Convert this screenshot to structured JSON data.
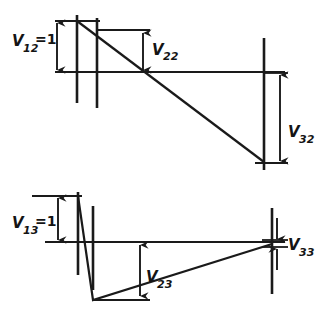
{
  "figure": {
    "background_color": "#ffffff",
    "line_color": "#1a1a1a"
  },
  "diagrams": [
    {
      "id": "upper-diagram",
      "name": "second-mode-diagram",
      "baseline_y": 72,
      "labels": [
        {
          "id": "v12",
          "name": "label-v12",
          "symbol": "V",
          "subscript": "12",
          "equals": "=1",
          "full_text": "V12=1",
          "x": 12,
          "y": 46
        },
        {
          "id": "v22",
          "name": "label-v22",
          "symbol": "V",
          "subscript": "22",
          "equals": "",
          "full_text": "V22",
          "x": 152,
          "y": 55
        },
        {
          "id": "v32",
          "name": "label-v32",
          "symbol": "V",
          "subscript": "32",
          "equals": "",
          "full_text": "V32",
          "x": 283,
          "y": 137
        }
      ],
      "node_lines": [
        {
          "name": "node-line-1",
          "x": 77,
          "y1": 15,
          "y2": 103
        },
        {
          "name": "node-line-2",
          "x": 97,
          "y1": 18,
          "y2": 108
        },
        {
          "name": "node-line-3",
          "x": 264,
          "y1": 38,
          "y2": 170
        }
      ],
      "deflection_path": "M 77 21 L 264 162",
      "dimensions": [
        {
          "name": "dim-v12",
          "x": 57,
          "y_top": 21,
          "y_bottom": 72
        },
        {
          "name": "dim-v22",
          "x": 143,
          "y_top": 33,
          "y_bottom": 72
        },
        {
          "name": "dim-v32",
          "x": 280,
          "y_top": 73,
          "y_bottom": 163
        }
      ]
    },
    {
      "id": "lower-diagram",
      "name": "third-mode-diagram",
      "baseline_y": 242,
      "labels": [
        {
          "id": "v13",
          "name": "label-v13",
          "symbol": "V",
          "subscript": "13",
          "equals": "=1",
          "full_text": "V13=1",
          "x": 12,
          "y": 228
        },
        {
          "id": "v23",
          "name": "label-v23",
          "symbol": "V",
          "subscript": "23",
          "equals": "",
          "full_text": "V23",
          "x": 148,
          "y": 282
        },
        {
          "id": "v33",
          "name": "label-v33",
          "symbol": "V",
          "subscript": "33",
          "equals": "",
          "full_text": "V33",
          "x": 291,
          "y": 250
        }
      ],
      "node_lines": [
        {
          "name": "node-line-1",
          "x": 78,
          "y1": 192,
          "y2": 275
        },
        {
          "name": "node-line-2",
          "x": 93,
          "y1": 206,
          "y2": 290
        },
        {
          "name": "node-line-3",
          "x": 272,
          "y1": 208,
          "y2": 294
        }
      ],
      "deflection_path": "M 78 196 L 93 300 L 272 244",
      "dimensions": [
        {
          "name": "dim-v13",
          "x": 58,
          "y_top": 196,
          "y_bottom": 242
        },
        {
          "name": "dim-v23",
          "x": 140,
          "y_top": 243,
          "y_bottom": 298
        },
        {
          "name": "dim-v33",
          "x": 277,
          "y_top": 218,
          "y_bottom": 270
        }
      ]
    }
  ]
}
